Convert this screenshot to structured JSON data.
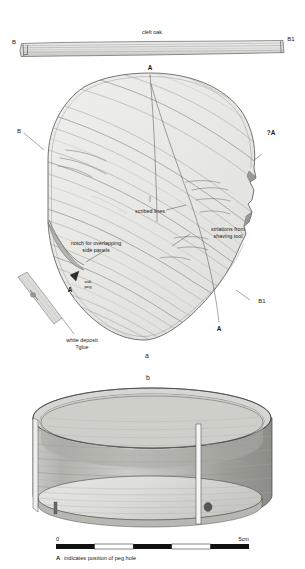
{
  "figure": {
    "parts": [
      {
        "key": "a",
        "label": "a"
      },
      {
        "key": "b",
        "label": "b"
      }
    ]
  },
  "section_view": {
    "material_label": "cleft oak",
    "end_left": "B",
    "end_right": "B1"
  },
  "disc_view": {
    "marker_top": "A",
    "marker_query": "?A",
    "marker_bottom": "A",
    "marker_peg": "A",
    "edge_left": "B",
    "edge_right": "B1",
    "annotations": [
      {
        "name": "scribed-lines",
        "text": "scribed lines"
      },
      {
        "name": "striations",
        "text": "striations from shaving tool"
      },
      {
        "name": "notch",
        "text": "notch for overlapping side panels"
      },
      {
        "name": "oak-peg",
        "text": "oak peg"
      },
      {
        "name": "white-deposit",
        "text": "white deposit ?glue"
      }
    ],
    "notch_line_1": "notch for overlapping",
    "notch_line_2": "side panels",
    "striations_line_1": "striations from",
    "striations_line_2": "shaving tool",
    "peg_line_1": "oak",
    "peg_line_2": "peg",
    "deposit_line_1": "white deposit",
    "deposit_line_2": "?glue"
  },
  "scale": {
    "start": "0",
    "end": "5cm",
    "segments": 5,
    "unit": "cm",
    "length_cm": 5
  },
  "caption": {
    "marker": "A",
    "text": "indicates position of peg hole"
  },
  "colors": {
    "background": "#ffffff",
    "wood_fill": "#e9e9e7",
    "wood_fill_dark": "#d2d2cf",
    "wood_fill_light": "#f2f2f0",
    "grain": "#8e8e8e",
    "outline": "#4a4a4a",
    "text": "#1a1a1a",
    "peg_dot": "#555555",
    "scale_bar": "#111111"
  }
}
